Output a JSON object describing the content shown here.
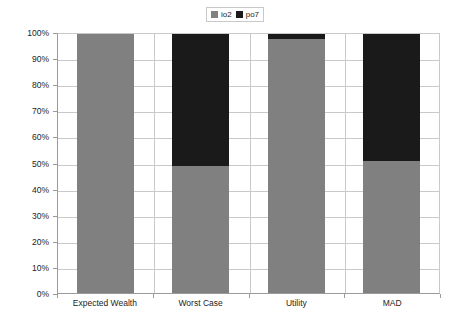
{
  "chart_data": {
    "type": "bar",
    "subtype": "stacked-column-100",
    "title": "",
    "xlabel": "",
    "ylabel": "Holding",
    "categories": [
      "Expected Wealth",
      "Worst Case",
      "Utility",
      "MAD"
    ],
    "series": [
      {
        "name": "io2",
        "color": "#808080",
        "values": [
          100,
          49,
          98,
          51
        ]
      },
      {
        "name": "po7",
        "color": "#1a1a1a",
        "values": [
          0,
          51,
          2,
          49
        ]
      }
    ],
    "ylim": [
      0,
      100
    ],
    "ytick_labels": [
      "0%",
      "10%",
      "20%",
      "30%",
      "40%",
      "50%",
      "60%",
      "70%",
      "80%",
      "90%",
      "100%"
    ],
    "ytick_values": [
      0,
      10,
      20,
      30,
      40,
      50,
      60,
      70,
      80,
      90,
      100
    ],
    "grid": true,
    "grid_color": "#c9c9c9",
    "legend_position": "top-center",
    "legend_entries": [
      {
        "label": "io2",
        "color": "#808080"
      },
      {
        "label": "po7",
        "color": "#1a1a1a"
      }
    ],
    "units": "percent"
  }
}
